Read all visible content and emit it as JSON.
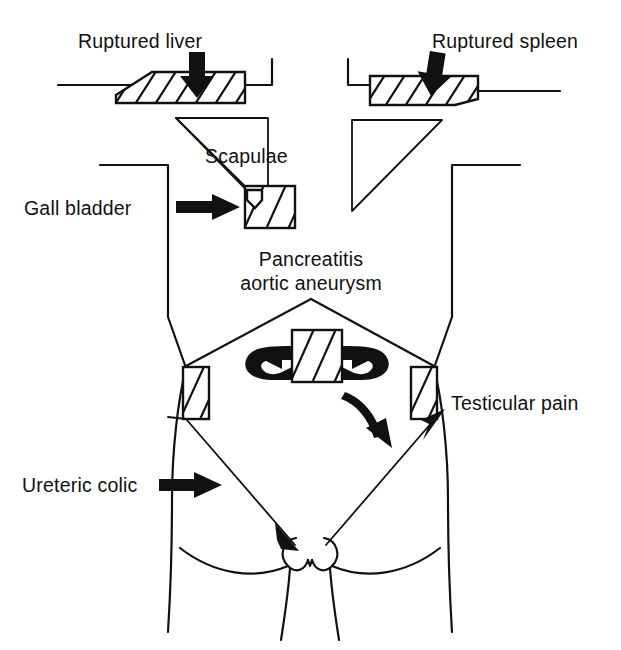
{
  "figure": {
    "background_color": "#ffffff",
    "ink_color": "#111111"
  },
  "labels": {
    "ruptured_liver": "Ruptured liver",
    "ruptured_spleen": "Ruptured spleen",
    "scapulae": "Scapulae",
    "gall_bladder": "Gall bladder",
    "pancreatitis": "Pancreatitis",
    "aortic_aneurysm": "aortic aneurysm",
    "testicular_pain": "Testicular pain",
    "ureteric_colic": "Ureteric colic"
  },
  "structures": [
    {
      "name": "ruptured-liver-organ",
      "kind": "hatched-slab",
      "side": "left",
      "label": "Ruptured liver"
    },
    {
      "name": "ruptured-spleen-organ",
      "kind": "hatched-slab",
      "side": "right",
      "label": "Ruptured spleen"
    },
    {
      "name": "left-scapula-triangle",
      "kind": "triangle",
      "side": "left",
      "label": "Scapulae"
    },
    {
      "name": "right-scapula-triangle",
      "kind": "triangle",
      "side": "right",
      "label": "Scapulae"
    },
    {
      "name": "gall-bladder-organ",
      "kind": "hatched-square",
      "side": "left",
      "label": "Gall bladder"
    },
    {
      "name": "pancreas-organ",
      "kind": "hatched-block",
      "side": "center",
      "label": "Pancreatitis aortic aneurysm"
    },
    {
      "name": "left-flank-organ",
      "kind": "hatched-rect",
      "side": "left",
      "label": "Ureteric colic"
    },
    {
      "name": "right-flank-organ",
      "kind": "hatched-rect",
      "side": "right",
      "label": "Testicular pain"
    }
  ],
  "pointers": [
    {
      "name": "liver-down-arrow",
      "style": "thick-straight",
      "direction": "down"
    },
    {
      "name": "spleen-down-arrow",
      "style": "thick-straight",
      "direction": "down"
    },
    {
      "name": "gall-bladder-arrow",
      "style": "thick-straight",
      "direction": "right"
    },
    {
      "name": "ureteric-colic-arrow",
      "style": "thick-straight",
      "direction": "right"
    },
    {
      "name": "pancreas-left-curved-arrow",
      "style": "curved-loop",
      "direction": "left"
    },
    {
      "name": "pancreas-right-curved-arrow",
      "style": "curved-loop",
      "direction": "right"
    },
    {
      "name": "pancreas-down-curved-arrow",
      "style": "curved",
      "direction": "down-right"
    },
    {
      "name": "left-referral-line",
      "style": "thin-line-arrow",
      "direction": "down-right"
    },
    {
      "name": "right-referral-line",
      "style": "thin-line-arrow",
      "direction": "up-right"
    },
    {
      "name": "left-scapula-referral-line",
      "style": "thin-line",
      "direction": "down-right"
    }
  ]
}
